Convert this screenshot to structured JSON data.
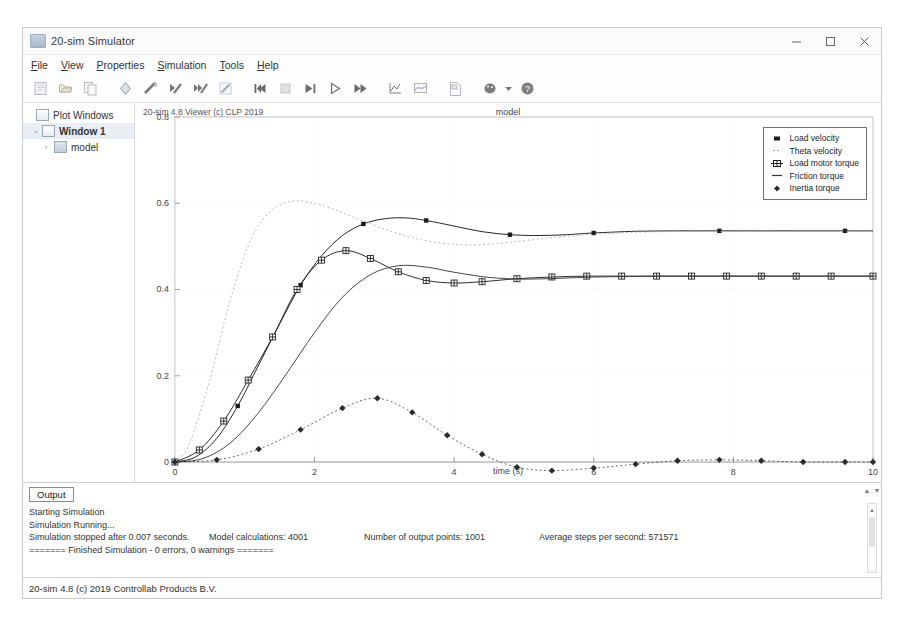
{
  "window": {
    "title": "20-sim Simulator",
    "icon": "app-icon",
    "controls": {
      "minimize": "minimize-icon",
      "maximize": "maximize-icon",
      "close": "close-icon"
    }
  },
  "menu": [
    {
      "label": "File",
      "accel": "F"
    },
    {
      "label": "View",
      "accel": "V"
    },
    {
      "label": "Properties",
      "accel": "P"
    },
    {
      "label": "Simulation",
      "accel": "S"
    },
    {
      "label": "Tools",
      "accel": "T"
    },
    {
      "label": "Help",
      "accel": "H"
    }
  ],
  "toolbar": [
    {
      "name": "new-icon"
    },
    {
      "name": "open-icon"
    },
    {
      "name": "copy-icon"
    },
    {
      "name": "sep"
    },
    {
      "name": "check-model-icon"
    },
    {
      "name": "run-check-icon"
    },
    {
      "name": "step-check-icon"
    },
    {
      "name": "multi-check-icon"
    },
    {
      "name": "edit-icon"
    },
    {
      "name": "sep"
    },
    {
      "name": "rewind-icon"
    },
    {
      "name": "stop-icon"
    },
    {
      "name": "step-forward-icon"
    },
    {
      "name": "play-icon"
    },
    {
      "name": "fast-forward-icon"
    },
    {
      "name": "sep"
    },
    {
      "name": "plot-xy-icon"
    },
    {
      "name": "plot-area-icon"
    },
    {
      "name": "sep"
    },
    {
      "name": "report-icon"
    },
    {
      "name": "sep"
    },
    {
      "name": "palette-icon"
    },
    {
      "name": "dropdown-caret-icon"
    },
    {
      "name": "help-icon"
    }
  ],
  "sidebar": {
    "items": [
      {
        "label": "Plot Windows",
        "level": 0,
        "twisty": "",
        "icon": "window-icon",
        "bold": false,
        "selected": false
      },
      {
        "label": "Window 1",
        "level": 1,
        "twisty": "⌄",
        "icon": "window-icon",
        "bold": true,
        "selected": true
      },
      {
        "label": "model",
        "level": 2,
        "twisty": "›",
        "icon": "plot-icon",
        "bold": false,
        "selected": false
      }
    ]
  },
  "plot": {
    "viewer_label": "20-sim 4.8 Viewer (c) CLP 2019",
    "title": "model",
    "xlabel": "time (s)"
  },
  "chart_data": {
    "type": "line",
    "title": "model",
    "xlabel": "time (s)",
    "ylabel": "",
    "xlim": [
      0,
      10
    ],
    "ylim": [
      0,
      0.8
    ],
    "xticks": [
      0,
      2,
      4,
      6,
      8,
      10
    ],
    "yticks": [
      0,
      0.2,
      0.4,
      0.6,
      0.8
    ],
    "grid": true,
    "legend_position": "top-right",
    "series": [
      {
        "name": "Load velocity",
        "marker": "filled-square",
        "style": "solid",
        "color": "#1a1a1a",
        "x": [
          0,
          0.3,
          0.6,
          0.9,
          1.2,
          1.5,
          1.8,
          2.1,
          2.4,
          2.7,
          3.0,
          3.3,
          3.6,
          4.0,
          4.4,
          4.8,
          5.2,
          5.6,
          6.0,
          6.6,
          7.2,
          7.8,
          8.4,
          9.0,
          9.6,
          10.0
        ],
        "y": [
          0,
          0.012,
          0.055,
          0.13,
          0.225,
          0.32,
          0.41,
          0.478,
          0.525,
          0.552,
          0.564,
          0.566,
          0.56,
          0.547,
          0.534,
          0.527,
          0.525,
          0.527,
          0.531,
          0.535,
          0.536,
          0.536,
          0.536,
          0.536,
          0.536,
          0.536
        ]
      },
      {
        "name": "Theta velocity",
        "marker": "dashed-line",
        "style": "dotted",
        "color": "#9a9a9a",
        "x": [
          0,
          0.2,
          0.5,
          0.8,
          1.1,
          1.4,
          1.7,
          2.0,
          2.3,
          2.6,
          3.0,
          3.4,
          3.8,
          4.2,
          4.6,
          5.0,
          5.4,
          5.8,
          6.2,
          6.6,
          7.0,
          7.5,
          8.0,
          8.6,
          9.2,
          10.0
        ],
        "y": [
          0,
          0.04,
          0.19,
          0.38,
          0.52,
          0.585,
          0.605,
          0.6,
          0.585,
          0.565,
          0.54,
          0.52,
          0.508,
          0.503,
          0.506,
          0.513,
          0.52,
          0.526,
          0.53,
          0.533,
          0.534,
          0.535,
          0.535,
          0.535,
          0.535,
          0.535
        ]
      },
      {
        "name": "Load motor torque",
        "marker": "square-cross",
        "style": "solid",
        "color": "#222222",
        "x": [
          0,
          0.35,
          0.7,
          1.05,
          1.4,
          1.75,
          2.1,
          2.45,
          2.8,
          3.2,
          3.6,
          4.0,
          4.4,
          4.9,
          5.4,
          5.9,
          6.4,
          6.9,
          7.4,
          7.9,
          8.4,
          8.9,
          9.4,
          10.0
        ],
        "y": [
          0,
          0.028,
          0.095,
          0.19,
          0.29,
          0.4,
          0.468,
          0.49,
          0.472,
          0.441,
          0.421,
          0.415,
          0.418,
          0.425,
          0.429,
          0.431,
          0.431,
          0.431,
          0.431,
          0.431,
          0.431,
          0.431,
          0.431,
          0.431
        ]
      },
      {
        "name": "Friction torque",
        "marker": "dash",
        "style": "solid",
        "color": "#3a3a3a",
        "x": [
          0,
          0.4,
          0.8,
          1.2,
          1.6,
          2.0,
          2.4,
          2.8,
          3.2,
          3.6,
          4.0,
          4.5,
          5.0,
          5.5,
          6.0,
          6.5,
          7.0,
          7.5,
          8.0,
          8.6,
          9.2,
          10.0
        ],
        "y": [
          0,
          0.008,
          0.045,
          0.115,
          0.205,
          0.3,
          0.382,
          0.434,
          0.455,
          0.452,
          0.44,
          0.428,
          0.424,
          0.426,
          0.429,
          0.43,
          0.431,
          0.431,
          0.431,
          0.431,
          0.431,
          0.431
        ]
      },
      {
        "name": "Inertia torque",
        "marker": "filled-diamond",
        "style": "dotted",
        "color": "#2a2a2a",
        "x": [
          0,
          0.6,
          1.2,
          1.8,
          2.4,
          2.9,
          3.4,
          3.9,
          4.4,
          4.9,
          5.4,
          6.0,
          6.6,
          7.2,
          7.8,
          8.4,
          9.0,
          9.6,
          10.0
        ],
        "y": [
          0,
          0.005,
          0.03,
          0.075,
          0.125,
          0.148,
          0.115,
          0.062,
          0.018,
          -0.012,
          -0.02,
          -0.014,
          -0.005,
          0.003,
          0.005,
          0.003,
          0.0,
          0.0,
          0.0
        ]
      }
    ]
  },
  "output": {
    "tab_label": "Output",
    "lines": [
      "Starting Simulation",
      "Simulation Running..."
    ],
    "stats": {
      "stopped": "Simulation stopped after 0.007 seconds.",
      "calculations": "Model calculations: 4001",
      "points": "Number of output points: 1001",
      "steps": "Average steps per second: 571571"
    },
    "finished": "======= Finished Simulation - 0 errors, 0 warnings ======="
  },
  "statusbar": {
    "text": "20-sim 4.8 (c) 2019 Controllab Products B.V."
  }
}
